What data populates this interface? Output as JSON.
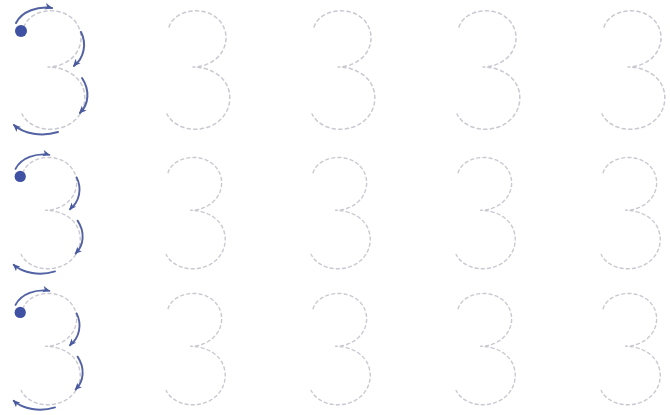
{
  "worksheet": {
    "title": "Number 3 tracing practice worksheet",
    "description": "Three rows of dashed outline numeral 3 glyphs for handwriting practice; the first glyph of each row shows stroke-order guidance.",
    "background_color": "#ffffff",
    "canvas": {
      "width": 670,
      "height": 415
    },
    "character": "3",
    "columns_per_row": 5,
    "rows_count": 3,
    "colors": {
      "dashed_guide": "#c9c9d2",
      "arrow": "#4a5a9e",
      "start_dot": "#3f51a3",
      "background": "#ffffff"
    },
    "stroke_guide": {
      "start_dot_label": "start-point",
      "arrows": [
        {
          "name": "top-arrow",
          "direction": "rightward",
          "description": "Begin at the dot and sweep right across the top"
        },
        {
          "name": "upper-bowl-arrow",
          "direction": "downward",
          "description": "Curve down and around the upper bowl"
        },
        {
          "name": "lower-bowl-arrow",
          "direction": "downward",
          "description": "Continue curving down around the lower bowl"
        },
        {
          "name": "bottom-arrow",
          "direction": "leftward",
          "description": "Finish sweeping left along the bottom"
        }
      ]
    },
    "rows": [
      {
        "index": 1,
        "name": "tracing-row-1",
        "top": 5,
        "scale": 1.0,
        "guided": true,
        "cells": [
          {
            "index": 1,
            "name": "tracing-cell-1-1",
            "left": 8,
            "guided": true
          },
          {
            "index": 2,
            "name": "tracing-cell-1-2",
            "left": 153,
            "guided": false
          },
          {
            "index": 3,
            "name": "tracing-cell-1-3",
            "left": 298,
            "guided": false
          },
          {
            "index": 4,
            "name": "tracing-cell-1-4",
            "left": 443,
            "guided": false
          },
          {
            "index": 5,
            "name": "tracing-cell-1-5",
            "left": 588,
            "guided": false
          }
        ]
      },
      {
        "index": 2,
        "name": "tracing-row-2",
        "top": 152,
        "scale": 0.94,
        "guided": true,
        "cells": [
          {
            "index": 1,
            "name": "tracing-cell-2-1",
            "left": 8,
            "guided": true
          },
          {
            "index": 2,
            "name": "tracing-cell-2-2",
            "left": 153,
            "guided": false
          },
          {
            "index": 3,
            "name": "tracing-cell-2-3",
            "left": 298,
            "guided": false
          },
          {
            "index": 4,
            "name": "tracing-cell-2-4",
            "left": 443,
            "guided": false
          },
          {
            "index": 5,
            "name": "tracing-cell-2-5",
            "left": 588,
            "guided": false
          }
        ]
      },
      {
        "index": 3,
        "name": "tracing-row-3",
        "top": 288,
        "scale": 0.94,
        "guided": true,
        "cells": [
          {
            "index": 1,
            "name": "tracing-cell-3-1",
            "left": 8,
            "guided": true
          },
          {
            "index": 2,
            "name": "tracing-cell-3-2",
            "left": 153,
            "guided": false
          },
          {
            "index": 3,
            "name": "tracing-cell-3-3",
            "left": 298,
            "guided": false
          },
          {
            "index": 4,
            "name": "tracing-cell-3-4",
            "left": 443,
            "guided": false
          },
          {
            "index": 5,
            "name": "tracing-cell-3-5",
            "left": 588,
            "guided": false
          }
        ]
      }
    ]
  }
}
